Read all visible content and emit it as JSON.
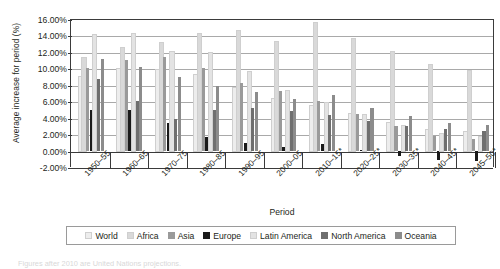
{
  "chart_data": {
    "type": "bar",
    "title": "",
    "xlabel": "Period",
    "ylabel": "Average increase for period (%)",
    "ylim": [
      -2,
      16
    ],
    "ytick_labels": [
      "16.00%",
      "14.00%",
      "12.00%",
      "10.00%",
      "8.00%",
      "6.00%",
      "4.00%",
      "2.00%",
      "0.00%",
      "-2.00%"
    ],
    "ytick_values": [
      16,
      14,
      12,
      10,
      8,
      6,
      4,
      2,
      0,
      -2
    ],
    "grid": true,
    "legend_position": "bottom",
    "categories": [
      "1950–55",
      "1960–65",
      "1970–75",
      "1980–85",
      "1990–95",
      "2000–05",
      "2010–15*",
      "2020–25*",
      "2030–35*",
      "2040–45*",
      "2045–50*"
    ],
    "series": [
      {
        "name": "World",
        "color": "#ededed",
        "values": [
          9.0,
          9.9,
          9.8,
          9.2,
          7.6,
          6.3,
          5.4,
          4.4,
          3.4,
          2.5,
          2.2
        ]
      },
      {
        "name": "Africa",
        "color": "#d9d9d9",
        "values": [
          11.3,
          12.5,
          13.1,
          14.2,
          14.5,
          13.2,
          15.5,
          13.6,
          12.0,
          10.4,
          9.7
        ]
      },
      {
        "name": "Asia",
        "color": "#9a9a9a",
        "values": [
          10.1,
          11.0,
          11.4,
          10.0,
          8.2,
          7.2,
          6.0,
          4.4,
          3.0,
          1.8,
          1.4
        ]
      },
      {
        "name": "Europe",
        "color": "#1a1a1a",
        "values": [
          4.9,
          4.9,
          3.3,
          1.6,
          0.9,
          0.4,
          0.8,
          0.1,
          -0.6,
          -1.1,
          -1.3
        ]
      },
      {
        "name": "Latin America",
        "color": "#e3e3e3",
        "values": [
          14.1,
          14.2,
          12.0,
          11.9,
          9.6,
          7.2,
          5.8,
          4.3,
          3.0,
          2.0,
          1.6
        ]
      },
      {
        "name": "North America",
        "color": "#6f6f6f",
        "values": [
          8.7,
          6.0,
          3.8,
          4.9,
          5.2,
          4.8,
          4.3,
          3.6,
          3.0,
          2.6,
          2.4
        ]
      },
      {
        "name": "Oceania",
        "color": "#8c8c8c",
        "values": [
          11.1,
          10.2,
          9.0,
          7.9,
          7.1,
          6.3,
          6.8,
          5.2,
          4.2,
          3.4,
          3.1
        ]
      }
    ]
  },
  "legend": {
    "items": [
      {
        "label": "World"
      },
      {
        "label": "Africa"
      },
      {
        "label": "Asia"
      },
      {
        "label": "Europe"
      },
      {
        "label": "Latin America"
      },
      {
        "label": "North America"
      },
      {
        "label": "Oceania"
      }
    ]
  },
  "footnote": {
    "text": "Figures after 2010 are United Nations projections."
  }
}
